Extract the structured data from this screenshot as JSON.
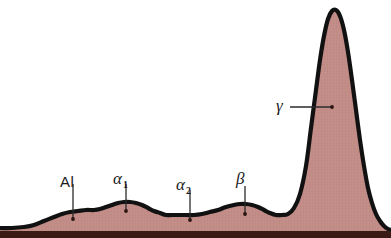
{
  "figure": {
    "kind": "serum-protein-electrophoresis-densitometry-trace",
    "background_color": "#ffffff",
    "curve_stroke_color": "#111111",
    "fill_color": "#c28c87",
    "baseline_color": "#3a1a14",
    "leader_color": "#2a2a2a"
  },
  "labels": {
    "albumin": "Al",
    "alpha1_main": "α",
    "alpha1_sub": "1",
    "alpha2_main": "α",
    "alpha2_sub": "2",
    "beta": "β",
    "gamma": "γ"
  },
  "chart_data": {
    "type": "area",
    "title": "",
    "subtitle": "",
    "xlabel": "",
    "ylabel": "",
    "xlim": [
      0,
      391
    ],
    "ylim": [
      0,
      238
    ],
    "grid": false,
    "legend": "none",
    "categories": [
      "Al",
      "α₁",
      "α₂",
      "β",
      "γ"
    ],
    "values": [
      14,
      17,
      12,
      16,
      215
    ],
    "annotations": [
      {
        "text": "Al",
        "label_x": 60,
        "label_y": 174,
        "leader_x": 73,
        "leader_y1": 184,
        "leader_y2": 219,
        "dot_x": 73,
        "dot_y": 219
      },
      {
        "text": "α₁",
        "label_x": 113,
        "label_y": 172,
        "leader_x": 126,
        "leader_y1": 184,
        "leader_y2": 211,
        "dot_x": 126,
        "dot_y": 211
      },
      {
        "text": "α₂",
        "label_x": 176,
        "label_y": 178,
        "leader_x": 190,
        "leader_y1": 190,
        "leader_y2": 220,
        "dot_x": 190,
        "dot_y": 220
      },
      {
        "text": "β",
        "label_x": 236,
        "label_y": 172,
        "leader_x": 245,
        "leader_y1": 186,
        "leader_y2": 214,
        "dot_x": 245,
        "dot_y": 214
      },
      {
        "text": "γ",
        "label_x": 277,
        "label_y": 99,
        "leader_x1": 290,
        "leader_x2": 332,
        "leader_y": 107,
        "dot_x": 332,
        "dot_y": 107
      }
    ],
    "series": [
      {
        "name": "densitometry-trace",
        "points": [
          [
            0,
            228
          ],
          [
            12,
            228
          ],
          [
            24,
            227
          ],
          [
            34,
            225
          ],
          [
            44,
            221
          ],
          [
            54,
            217
          ],
          [
            62,
            214
          ],
          [
            70,
            212
          ],
          [
            78,
            211
          ],
          [
            86,
            210
          ],
          [
            94,
            210
          ],
          [
            100,
            209
          ],
          [
            106,
            207
          ],
          [
            112,
            205
          ],
          [
            118,
            203
          ],
          [
            124,
            202
          ],
          [
            130,
            202
          ],
          [
            136,
            203
          ],
          [
            142,
            205
          ],
          [
            148,
            208
          ],
          [
            154,
            211
          ],
          [
            160,
            213
          ],
          [
            166,
            215
          ],
          [
            172,
            215
          ],
          [
            178,
            215
          ],
          [
            186,
            215
          ],
          [
            194,
            215
          ],
          [
            202,
            214
          ],
          [
            210,
            212
          ],
          [
            218,
            210
          ],
          [
            226,
            207
          ],
          [
            234,
            205
          ],
          [
            240,
            204
          ],
          [
            246,
            204
          ],
          [
            252,
            205
          ],
          [
            258,
            207
          ],
          [
            264,
            210
          ],
          [
            270,
            213
          ],
          [
            276,
            215
          ],
          [
            282,
            215
          ],
          [
            288,
            214
          ],
          [
            294,
            208
          ],
          [
            300,
            194
          ],
          [
            306,
            166
          ],
          [
            311,
            128
          ],
          [
            316,
            90
          ],
          [
            320,
            60
          ],
          [
            324,
            36
          ],
          [
            328,
            19
          ],
          [
            332,
            11
          ],
          [
            336,
            10
          ],
          [
            340,
            16
          ],
          [
            344,
            30
          ],
          [
            348,
            52
          ],
          [
            352,
            80
          ],
          [
            356,
            110
          ],
          [
            360,
            140
          ],
          [
            364,
            166
          ],
          [
            368,
            188
          ],
          [
            372,
            203
          ],
          [
            376,
            214
          ],
          [
            380,
            221
          ],
          [
            384,
            226
          ],
          [
            388,
            229
          ],
          [
            391,
            230
          ]
        ]
      }
    ]
  }
}
